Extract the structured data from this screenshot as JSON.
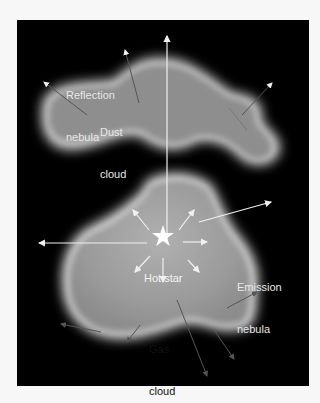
{
  "diagram": {
    "background": "#000000",
    "labels": {
      "reflection_nebula": [
        "Reflection",
        "nebula"
      ],
      "dust_cloud": [
        "Dust",
        "cloud"
      ],
      "hot_star": "Hot star",
      "emission_nebula": [
        "Emission",
        "nebula"
      ],
      "gas_cloud": [
        "Gas",
        "cloud"
      ]
    },
    "colors": {
      "light_text": "#e8e8e8",
      "dark_text": "#111111",
      "cloud": "#9a9a9a",
      "arrow_light": "#f0f0f0",
      "arrow_dark": "#555555"
    }
  }
}
